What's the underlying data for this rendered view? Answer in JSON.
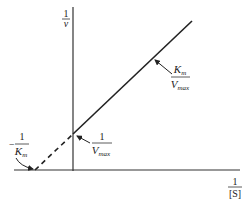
{
  "diagram": {
    "y_axis": {
      "numerator": "1",
      "denominator": "v"
    },
    "x_axis": {
      "numerator": "1",
      "denominator": "[S]"
    },
    "slope_label": {
      "numerator": "K",
      "numerator_sub": "m",
      "denominator": "V",
      "denominator_sub": "max"
    },
    "y_intercept_label": {
      "numerator": "1",
      "denominator": "V",
      "denominator_sub": "max"
    },
    "x_intercept_label": {
      "sign": "−",
      "numerator": "1",
      "denominator": "K",
      "denominator_sub": "m"
    },
    "colors": {
      "line": "#222222",
      "background": "#ffffff"
    }
  }
}
